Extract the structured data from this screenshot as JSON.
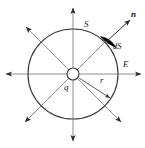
{
  "figure": {
    "width": 145,
    "height": 148,
    "background_color": "#ffffff",
    "line_color": "#3a3a3a",
    "field_line_color": "#7a7a7a",
    "patch_color": "#000000",
    "labels": {
      "surface": "S",
      "normal": "n",
      "area_element": "dS",
      "field": "E",
      "charge": "q",
      "radius": "r"
    },
    "geometry": {
      "center_x": 73,
      "center_y": 74,
      "sphere_radius": 45,
      "charge_marker_radius": 6,
      "field_arrow_length": 68,
      "radius_arrow_angle_deg": 35,
      "patch_angle_deg": 50
    },
    "field_line_count": 8,
    "field_line_directions": [
      "up",
      "up-right",
      "right",
      "down-right",
      "down",
      "down-left",
      "left",
      "up-left"
    ]
  }
}
